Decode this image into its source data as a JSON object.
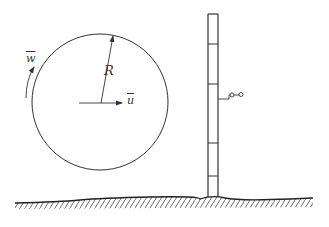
{
  "diagram": {
    "title": "",
    "labels": {
      "radius": "R",
      "translation_velocity": "u",
      "rotation_velocity": "w"
    },
    "elements": {
      "vortex_circle": {
        "cx": 100,
        "cy": 102,
        "r": 68
      },
      "radius_arrow": {
        "from": [
          101,
          103
        ],
        "to": [
          113,
          35
        ]
      },
      "translation_arrow": {
        "from": [
          79,
          103
        ],
        "to": [
          122,
          103
        ]
      },
      "rotation_arrow": {
        "direction": "counterclockwise (upward along left side)"
      },
      "mast": {
        "x_left": 208,
        "x_right": 218,
        "top": 14,
        "bottom": 197,
        "crossbars_y": [
          44,
          84,
          143,
          176
        ]
      },
      "sensor": {
        "attach_y": 98,
        "type": "anemometer"
      },
      "ground": {
        "x_start": 15,
        "x_end": 313,
        "hatched": true
      }
    },
    "colors": {
      "stroke": "#333333",
      "background": "#ffffff"
    }
  }
}
